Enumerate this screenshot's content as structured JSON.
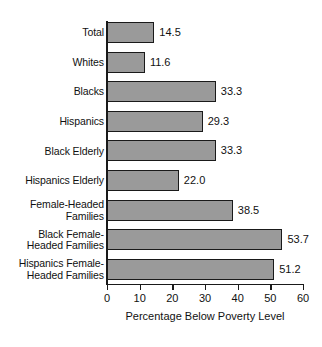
{
  "chart_data": {
    "type": "bar",
    "orientation": "horizontal",
    "title": "",
    "xlabel": "Percentage Below Poverty Level",
    "ylabel": "",
    "xlim": [
      0,
      60
    ],
    "xticks": [
      0,
      10,
      20,
      30,
      40,
      50,
      60
    ],
    "xtick_labels": [
      "0",
      "10",
      "20",
      "30",
      "40",
      "50",
      "60"
    ],
    "grid": false,
    "legend": null,
    "bar_color": "#9a9a9a",
    "bar_edge_color": "#1a1a1a",
    "background": "#ffffff",
    "categories": [
      "Total",
      "Whites",
      "Blacks",
      "Hispanics",
      "Black Elderly",
      "Hispanics Elderly",
      "Female-Headed\nFamilies",
      "Black Female-\nHeaded Families",
      "Hispanics Female-\nHeaded Families"
    ],
    "values": [
      14.5,
      11.6,
      33.3,
      29.3,
      33.3,
      22.0,
      38.5,
      53.7,
      51.2
    ],
    "value_labels": [
      "14.5",
      "11.6",
      "33.3",
      "29.3",
      "33.3",
      "22.0",
      "38.5",
      "53.7",
      "51.2"
    ]
  }
}
